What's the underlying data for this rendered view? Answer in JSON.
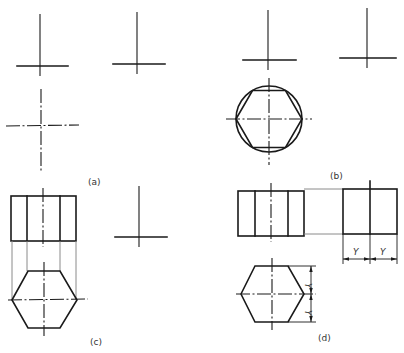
{
  "figure": {
    "panels": [
      {
        "id": "a",
        "label": "(a)",
        "description": "Three centre-line crosses positioning front, side and top views"
      },
      {
        "id": "b",
        "label": "(b)",
        "description": "Hexagon inscribed in circle drawn in top view"
      },
      {
        "id": "c",
        "label": "(c)",
        "description": "Front view projected down onto hexagon top view"
      },
      {
        "id": "d",
        "label": "(d)",
        "description": "Side view width transferred from plan using dimension Y"
      }
    ],
    "dimension_label": "Y",
    "colors": {
      "line": "#1a1a1a",
      "projection": "#8a8a8a",
      "background": "#ffffff"
    }
  }
}
